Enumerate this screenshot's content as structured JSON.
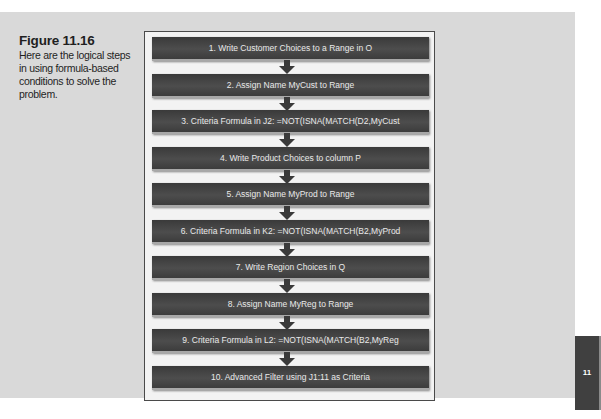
{
  "caption": {
    "title": "Figure 11.16",
    "text": "Here are the logical steps in using formula-based conditions to solve the problem."
  },
  "flowchart": {
    "steps": [
      {
        "label": "1. Write Customer Choices to a Range in O"
      },
      {
        "label": "2. Assign Name MyCust to Range"
      },
      {
        "label": "3. Criteria Formula in J2: =NOT(ISNA(MATCH(D2,MyCust"
      },
      {
        "label": "4. Write Product Choices to column  P"
      },
      {
        "label": "5. Assign Name MyProd to Range"
      },
      {
        "label": "6. Criteria Formula in K2: =NOT(ISNA(MATCH(B2,MyProd"
      },
      {
        "label": "7. Write Region Choices  in Q"
      },
      {
        "label": "8. Assign Name MyReg to Range"
      },
      {
        "label": "9. Criteria Formula in L2: =NOT(ISNA(MATCH(B2,MyReg"
      },
      {
        "label": "10. Advanced Filter using J1:11 as Criteria"
      }
    ],
    "connector_icon": "arrow-down-icon",
    "colors": {
      "box": "#444444",
      "text": "#e9e9e9",
      "frame": "#f3f3f3",
      "panel": "#d9d9d9"
    }
  },
  "chapter_tab": {
    "label": "11"
  }
}
